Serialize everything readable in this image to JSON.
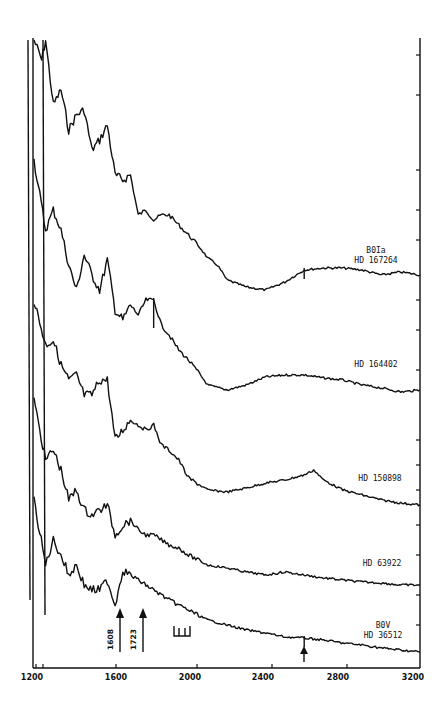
{
  "chart_data": {
    "type": "line",
    "title": "",
    "xlabel": "",
    "ylabel": "",
    "xlim": [
      1200,
      3200
    ],
    "x_ticks": [
      1200,
      1600,
      2000,
      2400,
      2800,
      3200
    ],
    "x_tick_labels": [
      "1200",
      "1600",
      "2000",
      "2400",
      "2800",
      "3200"
    ],
    "grid": false,
    "legend_position": "labels at right end of each spectrum",
    "series": [
      {
        "name": "B0Ia HD 167264",
        "label_lines": [
          "B0Ia",
          "HD 167264"
        ],
        "x": [
          1200,
          1240,
          1260,
          1300,
          1340,
          1380,
          1420,
          1460,
          1500,
          1540,
          1580,
          1620,
          1660,
          1700,
          1740,
          1780,
          1820,
          1860,
          1900,
          1950,
          2000,
          2050,
          2100,
          2150,
          2200,
          2300,
          2400,
          2500,
          2600,
          2700,
          2800,
          2900,
          3000,
          3100,
          3200
        ],
        "y_offset_px": [
          40,
          60,
          40,
          105,
          90,
          130,
          115,
          110,
          150,
          140,
          125,
          175,
          180,
          175,
          215,
          210,
          220,
          215,
          215,
          225,
          235,
          245,
          258,
          265,
          280,
          287,
          290,
          282,
          270,
          268,
          268,
          270,
          275,
          272,
          275
        ],
        "features": [
          {
            "x": 2600,
            "type": "absorption dip"
          }
        ]
      },
      {
        "name": "HD 164402",
        "label_lines": [
          "HD 164402"
        ],
        "x": [
          1200,
          1260,
          1300,
          1340,
          1380,
          1420,
          1460,
          1500,
          1540,
          1580,
          1620,
          1660,
          1700,
          1740,
          1780,
          1820,
          1860,
          1900,
          1950,
          2000,
          2050,
          2100,
          2200,
          2300,
          2400,
          2500,
          2600,
          2700,
          2800,
          2900,
          3000,
          3100,
          3200
        ],
        "y_offset_px": [
          160,
          230,
          210,
          230,
          265,
          290,
          255,
          275,
          290,
          260,
          310,
          320,
          305,
          315,
          300,
          300,
          325,
          335,
          350,
          360,
          372,
          385,
          390,
          385,
          377,
          375,
          375,
          378,
          380,
          385,
          388,
          392,
          390
        ],
        "features": [
          {
            "x": 1820,
            "type": "strong absorption dip"
          }
        ]
      },
      {
        "name": "HD 150898",
        "label_lines": [
          "HD 150898"
        ],
        "x": [
          1200,
          1260,
          1300,
          1340,
          1380,
          1420,
          1460,
          1500,
          1540,
          1580,
          1620,
          1660,
          1700,
          1740,
          1780,
          1820,
          1860,
          1900,
          1950,
          2000,
          2100,
          2200,
          2300,
          2400,
          2500,
          2600,
          2650,
          2700,
          2800,
          2900,
          3000,
          3100,
          3200
        ],
        "y_offset_px": [
          300,
          345,
          340,
          365,
          380,
          375,
          395,
          395,
          380,
          380,
          440,
          430,
          420,
          425,
          430,
          425,
          445,
          450,
          460,
          478,
          490,
          492,
          488,
          483,
          480,
          475,
          470,
          480,
          490,
          495,
          500,
          503,
          505
        ]
      },
      {
        "name": "HD 63922",
        "label_lines": [
          "HD 63922"
        ],
        "x": [
          1200,
          1260,
          1300,
          1340,
          1380,
          1420,
          1460,
          1500,
          1540,
          1580,
          1620,
          1660,
          1700,
          1740,
          1780,
          1820,
          1860,
          1900,
          1950,
          2000,
          2100,
          2200,
          2300,
          2400,
          2500,
          2600,
          2700,
          2800,
          2900,
          3000,
          3100,
          3200
        ],
        "y_offset_px": [
          400,
          460,
          450,
          470,
          500,
          490,
          510,
          515,
          510,
          505,
          535,
          525,
          520,
          530,
          535,
          535,
          540,
          545,
          548,
          555,
          565,
          568,
          572,
          575,
          572,
          575,
          578,
          580,
          582,
          583,
          585,
          585
        ]
      },
      {
        "name": "B0V HD 36512",
        "label_lines": [
          "B0V",
          "HD 36512"
        ],
        "x": [
          1200,
          1260,
          1300,
          1340,
          1380,
          1420,
          1460,
          1500,
          1540,
          1580,
          1620,
          1660,
          1700,
          1740,
          1780,
          1820,
          1860,
          1900,
          1950,
          2000,
          2100,
          2200,
          2300,
          2400,
          2500,
          2600,
          2700,
          2800,
          2900,
          3000,
          3100,
          3200
        ],
        "y_offset_px": [
          500,
          565,
          540,
          555,
          575,
          565,
          585,
          590,
          590,
          580,
          605,
          570,
          575,
          580,
          585,
          590,
          595,
          600,
          605,
          610,
          620,
          625,
          630,
          633,
          637,
          638,
          640,
          643,
          645,
          648,
          650,
          652
        ],
        "features": [
          {
            "x": 2600,
            "type": "marked dip (arrow)"
          }
        ]
      }
    ],
    "annotations": [
      {
        "type": "arrow",
        "label": "1608",
        "x": 1608
      },
      {
        "type": "arrow",
        "label": "1723",
        "x": 1723
      },
      {
        "type": "bracket",
        "label": "",
        "x_range": [
          1880,
          1960
        ],
        "description": "comb marker of three lines"
      },
      {
        "type": "arrow",
        "label": "",
        "x": 2600,
        "description": "upward arrow under B0V spectrum"
      }
    ]
  },
  "axis": {
    "x_tick_labels": [
      "1200",
      "1600",
      "2000",
      "2400",
      "2800",
      "3200"
    ]
  },
  "labels": {
    "s1_line1": "B0Ia",
    "s1_line2": "HD 167264",
    "s2": "HD 164402",
    "s3": "HD 150898",
    "s4": "HD 63922",
    "s5_line1": "B0V",
    "s5_line2": "HD 36512",
    "arrow1": "1608",
    "arrow2": "1723"
  }
}
